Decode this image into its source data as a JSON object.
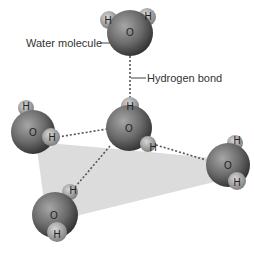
{
  "labels": {
    "water_molecule": "Water molecule",
    "hydrogen_bond": "Hydrogen bond"
  },
  "atoms": {
    "oxygen": "O",
    "hydrogen": "H"
  },
  "colors": {
    "oxygen_dark": "#3a3a3a",
    "oxygen_light": "#9a9a9a",
    "hydrogen": "#a8a8a8",
    "plane": "#d9d9d9",
    "bond": "#555555",
    "text": "#333333"
  },
  "molecules": [
    {
      "name": "top",
      "o": [
        130,
        32
      ],
      "h": [
        [
          109,
          20
        ],
        [
          147,
          17
        ]
      ]
    },
    {
      "name": "center",
      "o": [
        129,
        128
      ],
      "h": [
        [
          130,
          106
        ],
        [
          150,
          146
        ]
      ]
    },
    {
      "name": "left",
      "o": [
        33,
        132
      ],
      "h": [
        [
          26,
          107
        ],
        [
          52,
          137
        ]
      ]
    },
    {
      "name": "right",
      "o": [
        228,
        165
      ],
      "h": [
        [
          236,
          141
        ],
        [
          237,
          182
        ]
      ]
    },
    {
      "name": "bottom-left",
      "o": [
        54,
        215
      ],
      "h": [
        [
          72,
          190
        ],
        [
          57,
          234
        ]
      ]
    }
  ]
}
